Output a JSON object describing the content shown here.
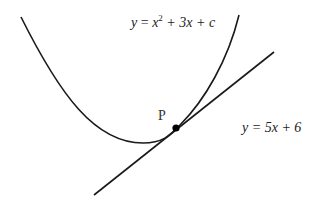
{
  "diagram": {
    "curve": {
      "label_parts": {
        "y": "y",
        "eq": " = ",
        "x": "x",
        "exp": "2",
        "rest": " + 3x + c"
      },
      "full_label": "y = x² + 3x + c"
    },
    "tangent": {
      "label": "y = 5x + 6"
    },
    "point": {
      "label": "P"
    },
    "colors": {
      "stroke": "#1a1a1a",
      "text": "#222222",
      "background": "#ffffff"
    }
  }
}
